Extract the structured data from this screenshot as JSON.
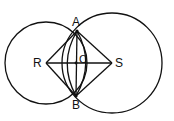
{
  "diagram": {
    "points": {
      "A": {
        "label": "A",
        "x": 77,
        "y": 31
      },
      "B": {
        "label": "B",
        "x": 76,
        "y": 96
      },
      "C": {
        "label": "C",
        "x": 76,
        "y": 63
      },
      "R": {
        "label": "R",
        "x": 46,
        "y": 63
      },
      "S": {
        "label": "S",
        "x": 112,
        "y": 63
      }
    },
    "circles": [
      {
        "center": "R",
        "r": 41
      },
      {
        "center": "S",
        "r": 50
      }
    ],
    "arcs": [
      {
        "center": "R",
        "through": [
          "A",
          "B"
        ],
        "note": "inner arc"
      },
      {
        "center": "S",
        "through": [
          "A",
          "B"
        ],
        "note": "inner arc"
      }
    ],
    "segments": [
      [
        "R",
        "A"
      ],
      [
        "A",
        "S"
      ],
      [
        "S",
        "B"
      ],
      [
        "B",
        "R"
      ],
      [
        "A",
        "B"
      ],
      [
        "R",
        "S"
      ]
    ],
    "stroke_color": "#111111"
  }
}
